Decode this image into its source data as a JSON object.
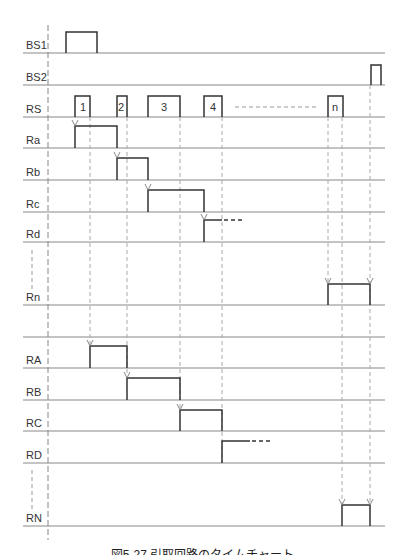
{
  "diagram": {
    "type": "timing-chart",
    "caption": "図5-27 引取回路のタイムチャート",
    "signals": [
      {
        "name": "BS1",
        "baseline_y": 53
      },
      {
        "name": "BS2",
        "baseline_y": 85
      },
      {
        "name": "RS",
        "baseline_y": 117
      },
      {
        "name": "Ra",
        "baseline_y": 148
      },
      {
        "name": "Rb",
        "baseline_y": 180
      },
      {
        "name": "Rc",
        "baseline_y": 212
      },
      {
        "name": "Rd",
        "baseline_y": 242
      },
      {
        "name": "Rn",
        "baseline_y": 305
      },
      {
        "name": "",
        "baseline_y": 337
      },
      {
        "name": "RA",
        "baseline_y": 368
      },
      {
        "name": "RB",
        "baseline_y": 400
      },
      {
        "name": "RC",
        "baseline_y": 431
      },
      {
        "name": "RD",
        "baseline_y": 463
      },
      {
        "name": "RN",
        "baseline_y": 526
      }
    ],
    "rs_pulses": [
      "1",
      "2",
      "3",
      "4",
      "n"
    ],
    "ellipsis": "- - - - - - - - -"
  }
}
